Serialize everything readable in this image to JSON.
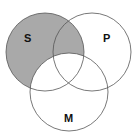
{
  "diagram": {
    "type": "venn",
    "circles": [
      {
        "id": "S",
        "label": "S",
        "cx": 45,
        "cy": 52,
        "r": 39
      },
      {
        "id": "P",
        "label": "P",
        "cx": 92,
        "cy": 52,
        "r": 39
      },
      {
        "id": "M",
        "label": "M",
        "cx": 69,
        "cy": 92,
        "r": 39
      }
    ],
    "shaded_region": "S minus M",
    "colors": {
      "shade": "#a9a9a9",
      "stroke": "#555555",
      "background": "#ffffff"
    }
  }
}
